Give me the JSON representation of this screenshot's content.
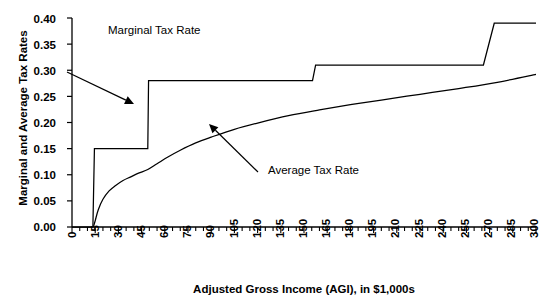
{
  "chart_data": {
    "type": "line",
    "title": "",
    "xlabel": "Adjusted Gross Income (AGI), in $1,000s",
    "ylabel": "Marginal and Average Tax Rates",
    "xlim": [
      0,
      300
    ],
    "ylim": [
      0.0,
      0.4
    ],
    "grid": false,
    "legend": "annotations",
    "xticks": [
      "0",
      "15",
      "30",
      "45",
      "60",
      "75",
      "90",
      "105",
      "120",
      "135",
      "150",
      "165",
      "180",
      "195",
      "210",
      "225",
      "240",
      "255",
      "270",
      "285",
      "300"
    ],
    "xtick_values": [
      0,
      15,
      30,
      45,
      60,
      75,
      90,
      105,
      120,
      135,
      150,
      165,
      180,
      195,
      210,
      225,
      240,
      255,
      270,
      285,
      300
    ],
    "minor_tick_step": 5,
    "yticks": [
      "0.00",
      "0.05",
      "0.10",
      "0.15",
      "0.20",
      "0.25",
      "0.30",
      "0.35",
      "0.40"
    ],
    "ytick_values": [
      0.0,
      0.05,
      0.1,
      0.15,
      0.2,
      0.25,
      0.3,
      0.35,
      0.4
    ],
    "series": [
      {
        "name": "Marginal Tax Rate",
        "shape": "step",
        "x": [
          0,
          13.5,
          14.5,
          49.0,
          49.5,
          155.5,
          157.5,
          266.0,
          273.0,
          300
        ],
        "values": [
          0.0,
          0.0,
          0.15,
          0.15,
          0.28,
          0.28,
          0.31,
          0.31,
          0.39,
          0.39
        ]
      },
      {
        "name": "Average Tax Rate",
        "shape": "curve",
        "x": [
          13.8,
          15,
          17,
          20,
          24,
          28,
          33,
          38,
          43,
          49,
          55,
          62,
          70,
          80,
          90,
          105,
          120,
          140,
          160,
          180,
          200,
          225,
          250,
          275,
          300
        ],
        "values": [
          0.0,
          0.012,
          0.033,
          0.053,
          0.069,
          0.079,
          0.089,
          0.096,
          0.103,
          0.11,
          0.121,
          0.134,
          0.147,
          0.161,
          0.172,
          0.187,
          0.199,
          0.213,
          0.224,
          0.234,
          0.243,
          0.254,
          0.265,
          0.277,
          0.292
        ]
      }
    ],
    "annotations": [
      {
        "name": "marginal-tax-rate-annotation",
        "text": "Marginal Tax Rate",
        "text_x": 0.0,
        "text_y": 0.4,
        "arrow_from": [
          67,
          72
        ],
        "arrow_to": [
          134,
          104
        ]
      },
      {
        "name": "average-tax-rate-annotation",
        "text": "Average Tax Rate",
        "text_x": 130,
        "text_y": 0.115,
        "arrow_from": [
          258,
          172
        ],
        "arrow_to": [
          209,
          124
        ]
      }
    ],
    "colors": {
      "line": "#000000",
      "axis": "#000000",
      "background": "#ffffff"
    }
  }
}
